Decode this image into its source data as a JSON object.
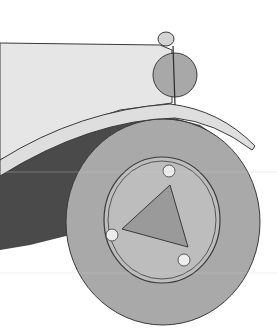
{
  "image": {
    "subject": "Watercolor-style drawing of a vintage car front wheel, fender and headlamp",
    "width": 277,
    "height": 336,
    "colors": {
      "background": "#ffffff",
      "body_panel": "#e6e6e6",
      "fender": "#dedede",
      "shadow": "#4a4a4a",
      "tire": "#a9a9a9",
      "hub": "#bdbdbd",
      "hub_triangle": "#9a9a9a",
      "headlamp": "#a8a8a8",
      "sidelamp": "#d4d4d4",
      "lug": "#ececec",
      "outline": "#3a3a3a"
    }
  }
}
